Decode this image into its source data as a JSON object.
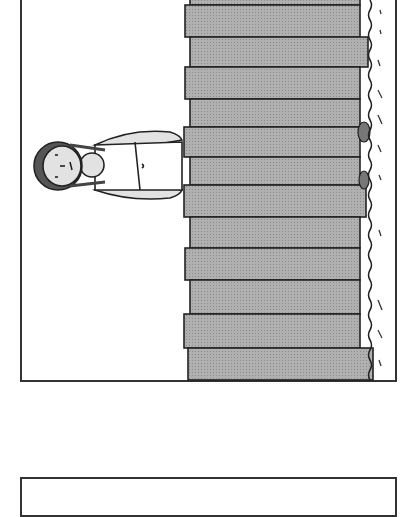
{
  "scene": {
    "description": "Rotated line illustration: a girl standing behind a wooden plank fence on grass",
    "colors": {
      "plank_fill": "#a9a9a9",
      "outline": "#222222",
      "skin_fill": "#e2e2e2",
      "background": "#ffffff"
    }
  },
  "panels": [
    {
      "name": "illustration-panel"
    },
    {
      "name": "empty-panel"
    }
  ]
}
